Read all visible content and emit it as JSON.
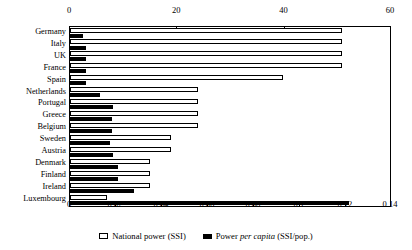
{
  "chart_data": {
    "type": "bar",
    "orientation": "horizontal",
    "title": "",
    "xlabel": "",
    "ylabel": "",
    "grid": false,
    "legend_position": "bottom-center",
    "categories": [
      "Germany",
      "Italy",
      "UK",
      "France",
      "Spain",
      "Netherlands",
      "Portugal",
      "Greece",
      "Belgium",
      "Sweden",
      "Austria",
      "Denmark",
      "Finland",
      "Ireland",
      "Luxembourg"
    ],
    "axes": {
      "top": {
        "label": "National power (SSI)",
        "ticks": [
          "0",
          "20",
          "40",
          "60"
        ],
        "tick_values": [
          0,
          20,
          40,
          60
        ],
        "range": [
          0,
          60
        ]
      },
      "bottom": {
        "label": "Power per capita (SSI/pop.)",
        "ticks": [
          "0",
          "0.02",
          "0.04",
          "0.06",
          "0.08",
          "0.1",
          "0.12",
          "0.14"
        ],
        "tick_values": [
          0,
          0.02,
          0.04,
          0.06,
          0.08,
          0.1,
          0.12,
          0.14
        ],
        "range": [
          0,
          0.14
        ]
      }
    },
    "series": [
      {
        "name": "National power (SSI)",
        "axis": "top",
        "style": "white-outlined",
        "values": [
          51.0,
          51.0,
          51.0,
          51.0,
          40.0,
          24.0,
          24.0,
          24.0,
          24.0,
          19.0,
          19.0,
          15.0,
          15.0,
          15.0,
          7.0
        ]
      },
      {
        "name": "Power per capita (SSI/pop.)",
        "axis": "bottom",
        "style": "solid-black",
        "values": [
          0.0055,
          0.007,
          0.007,
          0.007,
          0.0072,
          0.013,
          0.019,
          0.0185,
          0.0185,
          0.0175,
          0.019,
          0.021,
          0.021,
          0.028,
          0.122
        ]
      }
    ]
  },
  "legend": {
    "items": [
      {
        "marker": "white-square-icon",
        "label": "National power (SSI)"
      },
      {
        "marker": "black-square-icon",
        "label_prefix": "Power ",
        "label_italic": "per capita",
        "label_suffix": " (SSI/pop.)"
      }
    ]
  }
}
